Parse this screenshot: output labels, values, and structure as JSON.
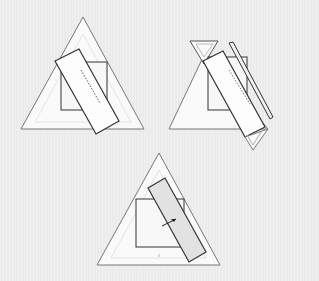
{
  "diagram": {
    "type": "folding-steps",
    "panels": [
      {
        "id": "step-1",
        "description": "triangle with square and rotated rectangle, dotted fold line"
      },
      {
        "id": "step-2",
        "description": "triangle with flap folded, rectangle and thin strip"
      },
      {
        "id": "step-3",
        "description": "triangle with square, shaded rectangle and arrow"
      }
    ]
  },
  "colors": {
    "background": "#ebebeb",
    "triangle_fill": "#fafafa",
    "stroke": "#333333",
    "light_stroke": "#bbbbbb",
    "shaded": "#e2e2e2"
  }
}
